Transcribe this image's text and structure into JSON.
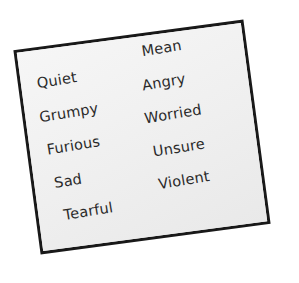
{
  "scene": {
    "background_color": "#ffffff",
    "description": "Tilted paper card listing emotion words in two columns"
  },
  "card": {
    "fill_color": "#f2f2f2",
    "border_color": "#191919",
    "border_width_px": 3,
    "rotation_deg": -7.6
  },
  "text": {
    "color": "#2a2a2a",
    "style": "handwritten"
  },
  "columns": [
    {
      "name": "left-column",
      "words": [
        {
          "label": "Quiet"
        },
        {
          "label": "Grumpy"
        },
        {
          "label": "Furious"
        },
        {
          "label": "Sad"
        },
        {
          "label": "Tearful"
        }
      ]
    },
    {
      "name": "right-column",
      "words": [
        {
          "label": "Mean"
        },
        {
          "label": "Angry"
        },
        {
          "label": "Worried"
        },
        {
          "label": "Unsure"
        },
        {
          "label": "Violent"
        }
      ]
    }
  ]
}
